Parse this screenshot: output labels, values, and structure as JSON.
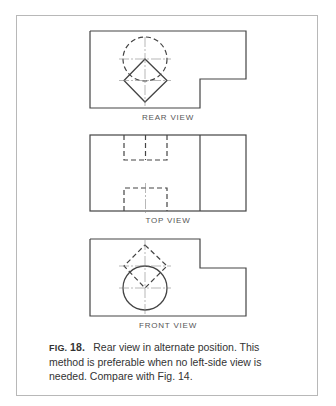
{
  "figure": {
    "number_label": "FIG.",
    "number_value": "18.",
    "caption": "Rear view in alternate position. This method is preferable when no left-side view is needed. Compare with Fig. 14."
  },
  "views": [
    {
      "label": "REAR VIEW"
    },
    {
      "label": "TOP VIEW"
    },
    {
      "label": "FRONT VIEW"
    }
  ],
  "colors": {
    "line": "#444444",
    "frame": "#b8b8b8",
    "text": "#333333"
  }
}
